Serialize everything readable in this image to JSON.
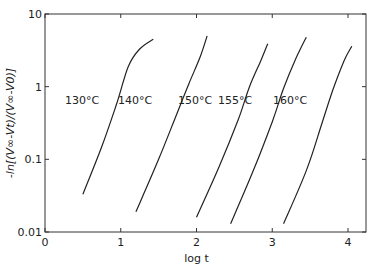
{
  "chart_data": {
    "type": "line",
    "title": "",
    "xlabel": "log t",
    "ylabel": "-ln[(V∞-Vt)/(V∞-V0)]",
    "xlim": [
      0,
      4.25
    ],
    "ylim": [
      0.01,
      10
    ],
    "yscale": "log",
    "grid": false,
    "legend": "inline labels",
    "x_ticks": [
      0,
      1,
      2,
      3,
      4
    ],
    "x_tick_labels": [
      "0",
      "1",
      "2",
      "3",
      "4"
    ],
    "y_ticks": [
      0.01,
      0.1,
      1,
      10
    ],
    "y_tick_labels": [
      "0.01",
      "0.1",
      "1",
      "10"
    ],
    "series": [
      {
        "name": "130°C",
        "label": "130°C",
        "x": [
          0.5,
          0.75,
          0.95,
          1.1,
          1.25,
          1.43
        ],
        "y": [
          0.033,
          0.15,
          0.6,
          1.9,
          3.3,
          4.5
        ]
      },
      {
        "name": "140°C",
        "label": "140°C",
        "x": [
          1.2,
          1.5,
          1.75,
          1.9,
          2.05,
          2.14
        ],
        "y": [
          0.019,
          0.1,
          0.45,
          1.1,
          2.6,
          5.0
        ]
      },
      {
        "name": "150°C",
        "label": "150°C",
        "x": [
          2.0,
          2.3,
          2.55,
          2.7,
          2.85,
          2.94
        ],
        "y": [
          0.016,
          0.08,
          0.35,
          1.0,
          2.3,
          3.9
        ]
      },
      {
        "name": "155°C",
        "label": "155°C",
        "x": [
          2.45,
          2.75,
          3.0,
          3.15,
          3.3,
          3.45
        ],
        "y": [
          0.013,
          0.07,
          0.33,
          0.95,
          2.3,
          4.8
        ]
      },
      {
        "name": "160°C",
        "label": "160°C",
        "x": [
          3.15,
          3.45,
          3.65,
          3.8,
          3.95,
          4.05
        ],
        "y": [
          0.013,
          0.07,
          0.3,
          0.9,
          2.3,
          3.6
        ]
      }
    ]
  },
  "labels": {
    "xlabel": "log t",
    "ylabel_prefix": "-ln[(V",
    "ylabel_full": "-ln[(V∞-Vt)/(V∞-V0)]"
  }
}
